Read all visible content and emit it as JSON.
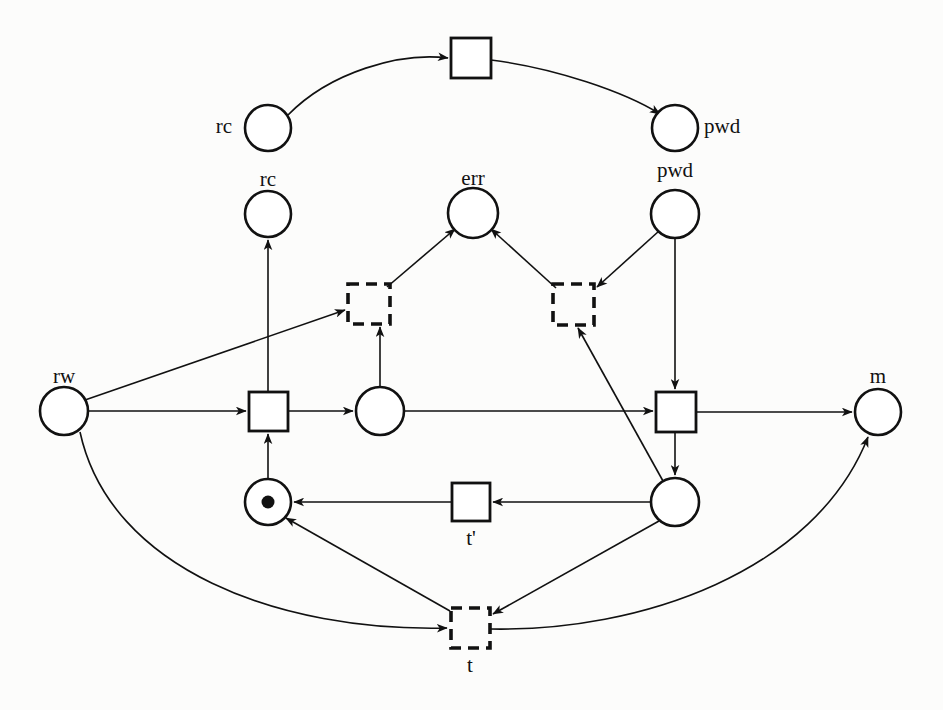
{
  "diagram": {
    "colors": {
      "ink": "#111111",
      "paper": "#fcfcfb"
    },
    "labels": {
      "rc_top": "rc",
      "pwd_top": "pwd",
      "rc_mid": "rc",
      "err": "err",
      "pwd_mid": "pwd",
      "rw": "rw",
      "m": "m",
      "t_prime": "t'",
      "t": "t"
    },
    "places": [
      {
        "id": "rc_top",
        "label": "rc",
        "label_pos": "left",
        "cx": 268,
        "cy": 128,
        "r": 23,
        "tokens": 0
      },
      {
        "id": "pwd_top",
        "label": "pwd",
        "label_pos": "right",
        "cx": 675,
        "cy": 128,
        "r": 23,
        "tokens": 0
      },
      {
        "id": "rc_mid",
        "label": "rc",
        "label_pos": "above",
        "cx": 268,
        "cy": 214,
        "r": 23,
        "tokens": 0
      },
      {
        "id": "err",
        "label": "err",
        "label_pos": "above",
        "cx": 473,
        "cy": 213,
        "r": 25,
        "tokens": 0
      },
      {
        "id": "pwd_mid",
        "label": "pwd",
        "label_pos": "above",
        "cx": 675,
        "cy": 214,
        "r": 24,
        "tokens": 0
      },
      {
        "id": "rw",
        "label": "rw",
        "label_pos": "above",
        "cx": 64,
        "cy": 411,
        "r": 24,
        "tokens": 0
      },
      {
        "id": "p_mid",
        "label": "",
        "label_pos": "none",
        "cx": 380,
        "cy": 411,
        "r": 24,
        "tokens": 0
      },
      {
        "id": "m",
        "label": "m",
        "label_pos": "above",
        "cx": 878,
        "cy": 412,
        "r": 23,
        "tokens": 0
      },
      {
        "id": "p_tok",
        "label": "",
        "label_pos": "none",
        "cx": 268,
        "cy": 502,
        "r": 23,
        "tokens": 1
      },
      {
        "id": "p_right",
        "label": "",
        "label_pos": "none",
        "cx": 675,
        "cy": 502,
        "r": 24,
        "tokens": 0
      }
    ],
    "transitions": [
      {
        "id": "t_top",
        "label": "",
        "style": "solid",
        "x": 451,
        "y": 38,
        "w": 40,
        "h": 40
      },
      {
        "id": "t_dl",
        "label": "",
        "style": "dashed",
        "x": 348,
        "y": 284,
        "w": 42,
        "h": 40
      },
      {
        "id": "t_dr",
        "label": "",
        "style": "dashed",
        "x": 553,
        "y": 284,
        "w": 41,
        "h": 41
      },
      {
        "id": "t_left",
        "label": "",
        "style": "solid",
        "x": 249,
        "y": 392,
        "w": 39,
        "h": 39
      },
      {
        "id": "t_right",
        "label": "",
        "style": "solid",
        "x": 656,
        "y": 392,
        "w": 40,
        "h": 40
      },
      {
        "id": "t_prime",
        "label": "t'",
        "style": "solid",
        "x": 452,
        "y": 483,
        "w": 38,
        "h": 38
      },
      {
        "id": "t_bottom",
        "label": "t",
        "style": "dashed",
        "x": 451,
        "y": 608,
        "w": 39,
        "h": 40
      }
    ],
    "arcs": [
      {
        "from": "rc_top",
        "to": "t_top",
        "shape": "curve"
      },
      {
        "from": "t_top",
        "to": "pwd_top",
        "shape": "curve"
      },
      {
        "from": "t_left",
        "to": "rc_mid",
        "shape": "straight"
      },
      {
        "from": "t_dl",
        "to": "err",
        "shape": "straight"
      },
      {
        "from": "t_dr",
        "to": "err",
        "shape": "straight"
      },
      {
        "from": "pwd_mid",
        "to": "t_dr",
        "shape": "straight"
      },
      {
        "from": "pwd_mid",
        "to": "t_right",
        "shape": "straight"
      },
      {
        "from": "rw",
        "to": "t_dl",
        "shape": "straight"
      },
      {
        "from": "rw",
        "to": "t_left",
        "shape": "straight"
      },
      {
        "from": "rw",
        "to": "t_bottom",
        "shape": "curve"
      },
      {
        "from": "t_left",
        "to": "p_mid",
        "shape": "straight"
      },
      {
        "from": "p_mid",
        "to": "t_dl",
        "shape": "straight"
      },
      {
        "from": "p_mid",
        "to": "t_right",
        "shape": "straight"
      },
      {
        "from": "p_tok",
        "to": "t_left",
        "shape": "straight"
      },
      {
        "from": "t_right",
        "to": "m",
        "shape": "straight"
      },
      {
        "from": "t_right",
        "to": "p_right",
        "shape": "straight"
      },
      {
        "from": "p_right",
        "to": "t_dr",
        "shape": "straight"
      },
      {
        "from": "p_right",
        "to": "t_prime",
        "shape": "straight"
      },
      {
        "from": "t_prime",
        "to": "p_tok",
        "shape": "straight"
      },
      {
        "from": "p_right",
        "to": "t_bottom",
        "shape": "straight"
      },
      {
        "from": "t_bottom",
        "to": "p_tok",
        "shape": "straight"
      },
      {
        "from": "t_bottom",
        "to": "m",
        "shape": "curve"
      }
    ]
  }
}
